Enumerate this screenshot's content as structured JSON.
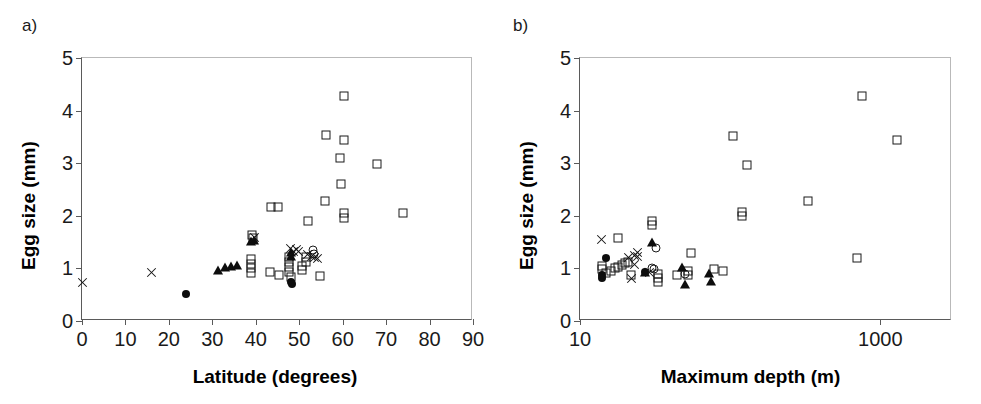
{
  "figure": {
    "background_color": "#ffffff",
    "axis_color": "#5a5a5a",
    "marker_color": "#111111"
  },
  "panels": {
    "a": {
      "label": "a)",
      "xlabel": "Latitude (degrees)",
      "ylabel": "Egg size (mm)",
      "xticks": [
        "0",
        "10",
        "20",
        "30",
        "40",
        "50",
        "60",
        "70",
        "80",
        "90"
      ],
      "yticks": [
        "0",
        "1",
        "2",
        "3",
        "4",
        "5"
      ]
    },
    "b": {
      "label": "b)",
      "xlabel": "Maximum depth (m)",
      "ylabel": "Egg size (mm)",
      "xticks": [
        "10",
        "1000"
      ],
      "yticks": [
        "0",
        "1",
        "2",
        "3",
        "4",
        "5"
      ]
    }
  },
  "chart_data": [
    {
      "type": "scatter",
      "panel": "a",
      "title": "a)",
      "xlabel": "Latitude (degrees)",
      "ylabel": "Egg size (mm)",
      "xscale": "linear",
      "yscale": "linear",
      "xlim": [
        0,
        90
      ],
      "ylim": [
        0,
        5
      ],
      "xticks": [
        0,
        10,
        20,
        30,
        40,
        50,
        60,
        70,
        80,
        90
      ],
      "yticks": [
        0,
        1,
        2,
        3,
        4,
        5
      ],
      "grid": false,
      "legend": "none",
      "series": [
        {
          "name": "open-square",
          "marker": "open square",
          "points": [
            [
              39.2,
              1.63
            ],
            [
              39.4,
              1.57
            ],
            [
              39.0,
              1.17
            ],
            [
              39.0,
              1.08
            ],
            [
              39.0,
              1.0
            ],
            [
              39.0,
              0.92
            ],
            [
              43.5,
              2.17
            ],
            [
              45.0,
              2.17
            ],
            [
              43.2,
              0.93
            ],
            [
              45.3,
              0.88
            ],
            [
              47.6,
              1.22
            ],
            [
              47.6,
              1.12
            ],
            [
              47.6,
              1.02
            ],
            [
              47.6,
              0.93
            ],
            [
              48.0,
              0.83
            ],
            [
              50.6,
              1.04
            ],
            [
              50.6,
              0.97
            ],
            [
              51.6,
              1.22
            ],
            [
              51.6,
              1.13
            ],
            [
              52.0,
              1.9
            ],
            [
              54.8,
              0.85
            ],
            [
              56.0,
              2.28
            ],
            [
              56.2,
              3.53
            ],
            [
              59.5,
              3.09
            ],
            [
              60.3,
              3.44
            ],
            [
              60.4,
              4.27
            ],
            [
              59.6,
              2.6
            ],
            [
              60.2,
              2.05
            ],
            [
              60.2,
              1.96
            ],
            [
              67.9,
              2.99
            ],
            [
              73.8,
              2.05
            ]
          ]
        },
        {
          "name": "filled-circle",
          "marker": "filled circle",
          "points": [
            [
              23.9,
              0.52
            ],
            [
              48.2,
              0.75
            ],
            [
              48.3,
              0.7
            ]
          ]
        },
        {
          "name": "open-circle",
          "marker": "open circle",
          "points": [
            [
              53.2,
              1.35
            ],
            [
              53.4,
              1.28
            ]
          ]
        },
        {
          "name": "filled-triangle",
          "marker": "filled triangle",
          "points": [
            [
              31.2,
              0.95
            ],
            [
              32.9,
              1.0
            ],
            [
              34.2,
              1.02
            ],
            [
              35.6,
              1.05
            ],
            [
              39.0,
              1.5
            ],
            [
              39.6,
              1.52
            ],
            [
              48.0,
              1.3
            ],
            [
              48.2,
              1.22
            ]
          ]
        },
        {
          "name": "cross",
          "marker": "cross (x)",
          "points": [
            [
              0.2,
              0.73
            ],
            [
              16.0,
              0.92
            ],
            [
              39.6,
              1.59
            ],
            [
              48.1,
              1.37
            ],
            [
              48.6,
              1.33
            ],
            [
              49.3,
              1.36
            ],
            [
              49.8,
              1.32
            ],
            [
              52.0,
              1.27
            ],
            [
              52.8,
              1.23
            ],
            [
              53.6,
              1.21
            ],
            [
              54.2,
              1.18
            ]
          ]
        }
      ]
    },
    {
      "type": "scatter",
      "panel": "b",
      "title": "b)",
      "xlabel": "Maximum depth (m)",
      "ylabel": "Egg size (mm)",
      "xscale": "log",
      "yscale": "linear",
      "xlim": [
        10,
        3000
      ],
      "ylim": [
        0,
        5
      ],
      "xticks": [
        10,
        1000
      ],
      "yticks": [
        0,
        1,
        2,
        3,
        4,
        5
      ],
      "grid": false,
      "legend": "none",
      "series": [
        {
          "name": "open-square",
          "marker": "open square",
          "points": [
            [
              18,
              1.58
            ],
            [
              14,
              1.05
            ],
            [
              14,
              0.98
            ],
            [
              15,
              0.92
            ],
            [
              16,
              0.95
            ],
            [
              17,
              1.0
            ],
            [
              18,
              1.03
            ],
            [
              19,
              1.07
            ],
            [
              20,
              1.1
            ],
            [
              21,
              1.13
            ],
            [
              22,
              0.88
            ],
            [
              30,
              1.9
            ],
            [
              30,
              1.82
            ],
            [
              33,
              0.9
            ],
            [
              33,
              0.82
            ],
            [
              33,
              0.75
            ],
            [
              44,
              0.87
            ],
            [
              55,
              1.3
            ],
            [
              52,
              0.95
            ],
            [
              52,
              0.88
            ],
            [
              78,
              0.98
            ],
            [
              90,
              0.95
            ],
            [
              120,
              2.08
            ],
            [
              120,
              2.0
            ],
            [
              130,
              2.97
            ],
            [
              105,
              3.52
            ],
            [
              330,
              2.28
            ],
            [
              700,
              1.2
            ],
            [
              760,
              4.27
            ],
            [
              1300,
              3.44
            ]
          ]
        },
        {
          "name": "filled-circle",
          "marker": "filled circle",
          "points": [
            [
              15,
              1.2
            ],
            [
              14,
              0.88
            ],
            [
              14,
              0.82
            ],
            [
              27,
              0.93
            ]
          ]
        },
        {
          "name": "open-circle",
          "marker": "open circle",
          "points": [
            [
              32,
              1.38
            ],
            [
              30,
              1.0
            ],
            [
              31,
              0.98
            ],
            [
              50,
              0.9
            ]
          ]
        },
        {
          "name": "filled-triangle",
          "marker": "filled triangle",
          "points": [
            [
              30,
              1.48
            ],
            [
              27,
              0.92
            ],
            [
              48,
              1.0
            ],
            [
              50,
              0.68
            ],
            [
              72,
              0.9
            ],
            [
              74,
              0.75
            ]
          ]
        },
        {
          "name": "cross",
          "marker": "cross (x)",
          "points": [
            [
              14,
              1.55
            ],
            [
              21,
              1.2
            ],
            [
              23,
              1.25
            ],
            [
              24,
              1.22
            ],
            [
              23,
              1.08
            ],
            [
              24,
              1.3
            ],
            [
              22,
              0.8
            ],
            [
              29,
              0.93
            ]
          ]
        }
      ]
    }
  ]
}
